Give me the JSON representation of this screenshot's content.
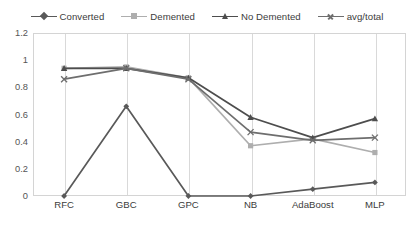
{
  "chart_data": {
    "type": "line",
    "title": "",
    "xlabel": "",
    "ylabel": "",
    "categories": [
      "RFC",
      "GBC",
      "GPC",
      "NB",
      "AdaBoost",
      "MLP"
    ],
    "ylim": [
      0,
      1.2
    ],
    "yticks": [
      "0",
      "0.2",
      "0.4",
      "0.6",
      "0.8",
      "1",
      "1.2"
    ],
    "ytick_values": [
      0,
      0.2,
      0.4,
      0.6,
      0.8,
      1,
      1.2
    ],
    "grid": "vertical-only",
    "legend_position": "top-center",
    "series": [
      {
        "name": "Converted",
        "values": [
          0,
          0.66,
          0,
          0,
          0.05,
          0.1
        ],
        "color": "#595959",
        "marker": "diamond"
      },
      {
        "name": "Demented",
        "values": [
          0.94,
          0.95,
          0.87,
          0.37,
          0.42,
          0.32
        ],
        "color": "#aeaeae",
        "marker": "square"
      },
      {
        "name": "No Demented",
        "values": [
          0.94,
          0.94,
          0.87,
          0.58,
          0.43,
          0.57
        ],
        "color": "#4d4d4d",
        "marker": "triangle"
      },
      {
        "name": "avg/total",
        "values": [
          0.86,
          0.94,
          0.86,
          0.47,
          0.41,
          0.43
        ],
        "color": "#6e6e6e",
        "marker": "cross"
      }
    ]
  }
}
